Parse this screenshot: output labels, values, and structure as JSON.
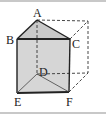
{
  "figure": {
    "type": "triangular prism inscribed in cube",
    "colors": {
      "face_fill": "#d4d4d4",
      "edge": "#222222",
      "dashed_edge": "#333333",
      "border": "#c8c8c8"
    },
    "labels": {
      "A": "A",
      "B": "B",
      "C": "C",
      "D": "D",
      "E": "E",
      "F": "F"
    }
  }
}
